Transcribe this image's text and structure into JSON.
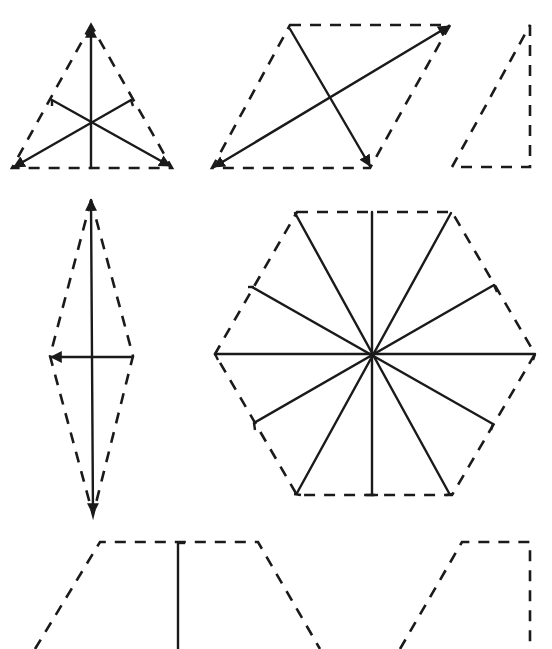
{
  "diagram": {
    "colors": {
      "background": "#ffffff",
      "ink": "#1a1a1a"
    },
    "figures": [
      {
        "id": "equilateral-triangle",
        "outline": "dashed",
        "symmetry_axes": 3
      },
      {
        "id": "parallelogram",
        "outline": "dashed",
        "lines": 2
      },
      {
        "id": "right-triangle",
        "outline": "dashed",
        "symmetry_axes": 0
      },
      {
        "id": "rhombus",
        "outline": "dashed",
        "symmetry_axes": 2
      },
      {
        "id": "regular-hexagon",
        "outline": "dashed",
        "symmetry_axes": 6
      },
      {
        "id": "isosceles-trapezoid",
        "outline": "dashed",
        "symmetry_axes": 1,
        "partially_visible": true
      },
      {
        "id": "right-trapezoid",
        "outline": "dashed",
        "symmetry_axes": 0,
        "partially_visible": true
      }
    ]
  }
}
